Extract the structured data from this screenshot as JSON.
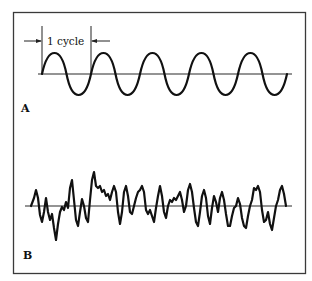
{
  "figure": {
    "panels": [
      {
        "label": "A",
        "description": "Regular sine wave with 5 cycles",
        "cycle_annotation": "1 cycle",
        "cycles": 5
      },
      {
        "label": "B",
        "description": "Irregular noise waveform"
      }
    ],
    "colors": {
      "line": "#111111",
      "frame": "#3a3a3a",
      "background": "#ffffff"
    }
  }
}
